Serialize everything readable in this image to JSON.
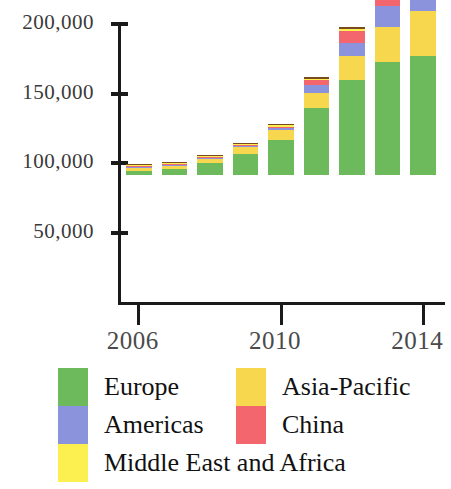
{
  "chart_data": {
    "type": "bar",
    "subtype": "stacked-vertical",
    "title": "",
    "xlabel": "",
    "ylabel": "",
    "categories": [
      "2006",
      "2007",
      "2008",
      "2009",
      "2010",
      "2011",
      "2012",
      "2013",
      "2014"
    ],
    "x_tick_labels": [
      "2006",
      "2010",
      "2014"
    ],
    "x_tick_categories": [
      "2006",
      "2010",
      "2014"
    ],
    "y_tick_labels": [
      "50,000",
      "100,000",
      "150,000",
      "200,000"
    ],
    "y_tick_values": [
      50000,
      100000,
      150000,
      200000
    ],
    "ylim": [
      0,
      200000
    ],
    "grid": false,
    "legend_position": "below",
    "series": [
      {
        "name": "Europe",
        "color": "#6cba5c",
        "values": [
          2800,
          4200,
          8400,
          15400,
          25200,
          48000,
          68600,
          81200,
          85400
        ]
      },
      {
        "name": "Middle East and Africa",
        "color": "#fbf04f",
        "values": [
          0,
          0,
          0,
          0,
          0,
          0,
          0,
          0,
          0
        ]
      },
      {
        "name": "Asia-Pacific",
        "color": "#f7d74e",
        "values": [
          2400,
          2500,
          3100,
          4600,
          7000,
          11200,
          16800,
          25200,
          32900
        ]
      },
      {
        "name": "Americas",
        "color": "#8b93dd",
        "values": [
          300,
          400,
          600,
          900,
          1400,
          5600,
          9800,
          15400,
          20300
        ]
      },
      {
        "name": "China",
        "color": "#f4666e",
        "values": [
          200,
          300,
          500,
          800,
          1200,
          3400,
          8400,
          18200,
          31500
        ]
      },
      {
        "name": "Middle East and Africa top band",
        "color": "#fbf04f",
        "values": [
          300,
          400,
          500,
          700,
          900,
          1100,
          1400,
          1800,
          2400
        ]
      },
      {
        "name": "Other",
        "color": "#7a4a1e",
        "values": [
          400,
          500,
          700,
          900,
          1100,
          1300,
          1500,
          1800,
          2100
        ]
      }
    ],
    "totals": [
      6400,
      8300,
      13800,
      23300,
      36800,
      70600,
      106500,
      143600,
      174600
    ]
  },
  "legend": {
    "entries": [
      {
        "label": "Europe",
        "color": "#6cba5c"
      },
      {
        "label": "Americas",
        "color": "#8b93dd"
      },
      {
        "label": "Middle East and Africa",
        "color": "#fbf04f"
      },
      {
        "label": "Asia-Pacific",
        "color": "#f7d74e"
      },
      {
        "label": "China",
        "color": "#f4666e"
      }
    ]
  },
  "axes": {
    "y_ticks": [
      {
        "label": "200,000",
        "value": 200000
      },
      {
        "label": "150,000",
        "value": 150000
      },
      {
        "label": "100,000",
        "value": 100000
      },
      {
        "label": "50,000",
        "value": 50000
      }
    ],
    "x_ticks": [
      {
        "label": "2006",
        "index": 0
      },
      {
        "label": "2010",
        "index": 4
      },
      {
        "label": "2014",
        "index": 8
      }
    ]
  },
  "colors": {
    "europe": "#6cba5c",
    "americas": "#8b93dd",
    "middle_east_africa": "#fbf04f",
    "asia_pacific": "#f7d74e",
    "china": "#f4666e",
    "other": "#7a4a1e",
    "axis": "#1a1a1a",
    "tick_text": "#3a3a3a",
    "legend_text": "#111111",
    "background": "#ffffff"
  }
}
